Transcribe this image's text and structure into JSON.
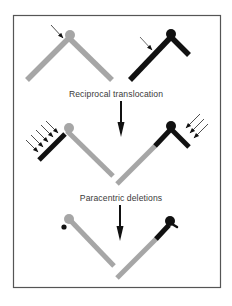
{
  "figure": {
    "colors": {
      "gray_chromosome": "#a6a6a6",
      "black_chromosome": "#111111",
      "frame": "#555555",
      "arrow": "#111111",
      "background": "#ffffff"
    },
    "steps": [
      {
        "id": "initial",
        "description": "Two chromosomes (gray and black), each with a small arrow marking a breakpoint near the centromere"
      },
      {
        "id": "translocated",
        "description": "Chromosomes after reciprocal translocation with multiple arrows marking breakpoints"
      },
      {
        "id": "deleted",
        "description": "Chromosomes after paracentric deletions"
      }
    ],
    "labels": {
      "step1_to_step2": "Reciprocal translocation",
      "step2_to_step3": "Paracentric deletions"
    }
  }
}
